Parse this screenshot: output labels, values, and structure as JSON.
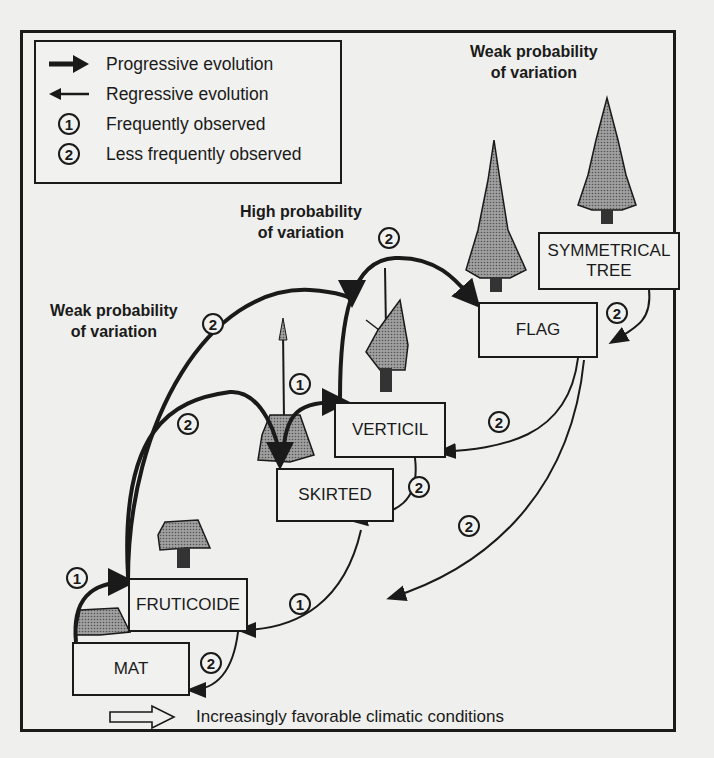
{
  "legend": {
    "items": [
      {
        "symbol": "thick-arrow-right-icon",
        "label": "Progressive evolution"
      },
      {
        "symbol": "thin-arrow-left-icon",
        "label": "Regressive evolution"
      },
      {
        "symbol": "1",
        "label": "Frequently observed"
      },
      {
        "symbol": "2",
        "label": "Less frequently observed"
      }
    ]
  },
  "annotations": {
    "weak_top": "Weak probability\nof variation",
    "high_mid": "High probability\nof variation",
    "weak_left": "Weak probability\nof variation"
  },
  "nodes": {
    "mat": "MAT",
    "fruticoide": "FRUTICOIDE",
    "skirted": "SKIRTED",
    "verticil": "VERTICIL",
    "flag": "FLAG",
    "symmetrical": "SYMMETRICAL\nTREE"
  },
  "transitions": [
    {
      "from": "MAT",
      "to": "FRUTICOIDE",
      "type": "progressive",
      "frequency": "1"
    },
    {
      "from": "FRUTICOIDE",
      "to": "SKIRTED",
      "type": "progressive",
      "frequency": "2"
    },
    {
      "from": "FRUTICOIDE",
      "to": "VERTICIL",
      "type": "progressive",
      "frequency": "2"
    },
    {
      "from": "SKIRTED",
      "to": "VERTICIL",
      "type": "progressive",
      "frequency": "1"
    },
    {
      "from": "VERTICIL",
      "to": "FLAG",
      "type": "progressive",
      "frequency": "2"
    },
    {
      "from": "SYMMETRICAL TREE",
      "to": "FLAG",
      "type": "regressive",
      "frequency": "2"
    },
    {
      "from": "FLAG",
      "to": "VERTICIL",
      "type": "regressive",
      "frequency": "2"
    },
    {
      "from": "FLAG",
      "to": "SKIRTED",
      "type": "regressive",
      "frequency": "2"
    },
    {
      "from": "VERTICIL",
      "to": "SKIRTED",
      "type": "regressive",
      "frequency": "2"
    },
    {
      "from": "SKIRTED",
      "to": "FRUTICOIDE",
      "type": "regressive",
      "frequency": "1"
    },
    {
      "from": "FRUTICOIDE",
      "to": "MAT",
      "type": "regressive",
      "frequency": "2"
    }
  ],
  "footer": {
    "icon": "hollow-arrow-right-icon",
    "label": "Increasingly favorable climatic conditions"
  },
  "colors": {
    "ink": "#1a1a1a",
    "paper": "#efefed",
    "tree_fill": "#8a8a8a"
  }
}
